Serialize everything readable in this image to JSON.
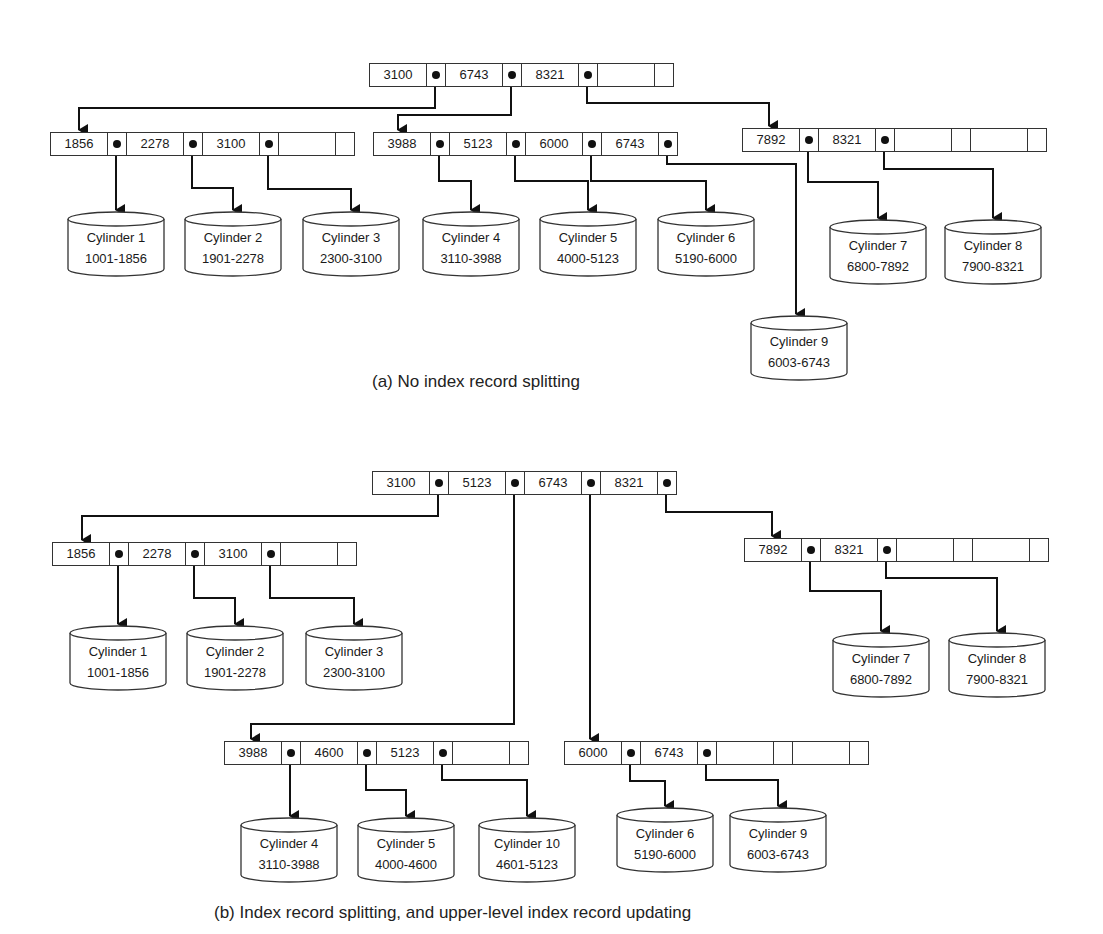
{
  "figure_a": {
    "caption": "(a) No index record splitting",
    "root": {
      "keys": [
        "3100",
        "6743",
        "8321"
      ],
      "empty_slots": 1
    },
    "level2": [
      {
        "keys": [
          "1856",
          "2278",
          "3100"
        ],
        "empty_slots": 1
      },
      {
        "keys": [
          "3988",
          "5123",
          "6000",
          "6743"
        ],
        "empty_slots": 0
      },
      {
        "keys": [
          "7892",
          "8321"
        ],
        "empty_slots": 2
      }
    ],
    "cylinders": [
      {
        "name": "Cylinder 1",
        "range": "1001-1856"
      },
      {
        "name": "Cylinder 2",
        "range": "1901-2278"
      },
      {
        "name": "Cylinder 3",
        "range": "2300-3100"
      },
      {
        "name": "Cylinder 4",
        "range": "3110-3988"
      },
      {
        "name": "Cylinder 5",
        "range": "4000-5123"
      },
      {
        "name": "Cylinder 6",
        "range": "5190-6000"
      },
      {
        "name": "Cylinder 7",
        "range": "6800-7892"
      },
      {
        "name": "Cylinder 8",
        "range": "7900-8321"
      },
      {
        "name": "Cylinder 9",
        "range": "6003-6743"
      }
    ]
  },
  "figure_b": {
    "caption": "(b) Index record splitting, and upper-level index record updating",
    "root": {
      "keys": [
        "3100",
        "5123",
        "6743",
        "8321"
      ],
      "empty_slots": 0
    },
    "level2": [
      {
        "keys": [
          "1856",
          "2278",
          "3100"
        ],
        "empty_slots": 1
      },
      {
        "keys": [
          "7892",
          "8321"
        ],
        "empty_slots": 2
      },
      {
        "keys": [
          "3988",
          "4600",
          "5123"
        ],
        "empty_slots": 1
      },
      {
        "keys": [
          "6000",
          "6743"
        ],
        "empty_slots": 2
      }
    ],
    "cylinders": [
      {
        "name": "Cylinder 1",
        "range": "1001-1856"
      },
      {
        "name": "Cylinder 2",
        "range": "1901-2278"
      },
      {
        "name": "Cylinder 3",
        "range": "2300-3100"
      },
      {
        "name": "Cylinder 7",
        "range": "6800-7892"
      },
      {
        "name": "Cylinder 8",
        "range": "7900-8321"
      },
      {
        "name": "Cylinder 4",
        "range": "3110-3988"
      },
      {
        "name": "Cylinder 5",
        "range": "4000-4600"
      },
      {
        "name": "Cylinder 10",
        "range": "4601-5123"
      },
      {
        "name": "Cylinder 6",
        "range": "5190-6000"
      },
      {
        "name": "Cylinder 9",
        "range": "6003-6743"
      }
    ]
  }
}
